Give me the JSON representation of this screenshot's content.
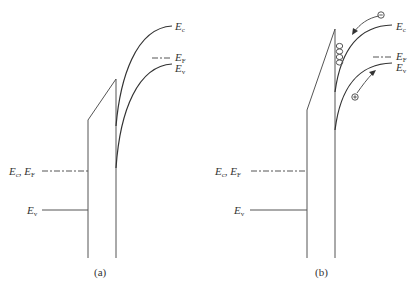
{
  "panels": [
    {
      "id": "a",
      "caption": "(a)",
      "labels": {
        "ec_right": "E",
        "ec_right_sub": "c",
        "ef_right": "E",
        "ef_right_sub": "F",
        "ev_right": "E",
        "ev_right_sub": "v",
        "ecef_left": "E",
        "ecef_left_sub1": "c",
        "ecef_left_mid": ", E",
        "ecef_left_sub2": "F",
        "ev_left": "E",
        "ev_left_sub": "v"
      }
    },
    {
      "id": "b",
      "caption": "(b)",
      "labels": {
        "ec_right": "E",
        "ec_right_sub": "c",
        "ef_right": "E",
        "ef_right_sub": "F",
        "ev_right": "E",
        "ev_right_sub": "v",
        "ecef_left": "E",
        "ecef_left_sub1": "c",
        "ecef_left_mid": ", E",
        "ecef_left_sub2": "F",
        "ev_left": "E",
        "ev_left_sub": "v"
      },
      "carriers": {
        "electron_symbol": "−",
        "hole_symbol": "+",
        "trapped_electrons_count": 4
      }
    }
  ],
  "colors": {
    "line": "#444444",
    "text": "#333333"
  }
}
